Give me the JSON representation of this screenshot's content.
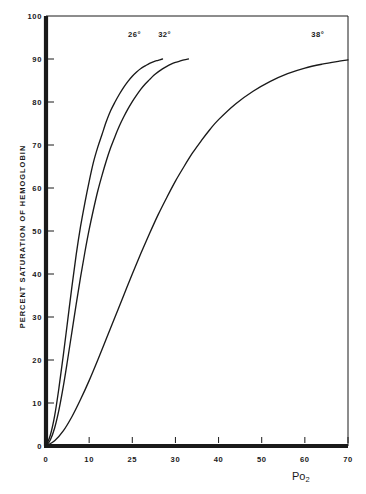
{
  "chart_data": {
    "type": "line",
    "title": "",
    "subtitle": "",
    "xlabel": "Po2",
    "xlabel_text": "Po",
    "xlabel_sub": "2",
    "ylabel": "PERCENT SATURATION OF HEMOGLOBIN",
    "xlim": [
      0,
      70
    ],
    "ylim": [
      0,
      100
    ],
    "xticks": [
      0,
      10,
      25,
      30,
      40,
      50,
      60,
      70
    ],
    "xtick_labels": [
      "0",
      "10",
      "25",
      "30",
      "40",
      "50",
      "60",
      "70"
    ],
    "yticks": [
      0,
      10,
      20,
      30,
      40,
      50,
      60,
      70,
      80,
      90,
      100
    ],
    "ytick_labels": [
      "0",
      "10",
      "20",
      "30",
      "40",
      "50",
      "60",
      "70",
      "80",
      "90",
      "100"
    ],
    "grid": false,
    "legend_position": "inline-annotations",
    "line_color": "#1a1a1a",
    "frame_color": "#1a1a1a",
    "background": "#ffffff",
    "series": [
      {
        "name": "26°",
        "label": "26°",
        "label_x": 20.5,
        "label_y": 95.5,
        "x": [
          0,
          1,
          2,
          3,
          4,
          5,
          6,
          7,
          8,
          9,
          10,
          11,
          12,
          13,
          14,
          15,
          16,
          17,
          18,
          19,
          20,
          21,
          22,
          23,
          24,
          25,
          26,
          27
        ],
        "values": [
          0,
          2.5,
          7,
          13.5,
          21,
          29,
          37,
          44.5,
          51,
          56.5,
          61.5,
          66,
          69.5,
          72.5,
          75.5,
          78,
          80,
          81.8,
          83.4,
          84.8,
          86,
          87,
          87.8,
          88.4,
          89,
          89.4,
          89.7,
          90
        ]
      },
      {
        "name": "32°",
        "label": "32°",
        "label_x": 27.5,
        "label_y": 95.5,
        "x": [
          0,
          1,
          2,
          3,
          4,
          5,
          6,
          7,
          8,
          9,
          10,
          11,
          12,
          13,
          14,
          15,
          16,
          17,
          18,
          19,
          20,
          21,
          22,
          23,
          24,
          25,
          26,
          27,
          28,
          29,
          30,
          31,
          32,
          33
        ],
        "values": [
          0,
          1.4,
          4.2,
          8.4,
          13.8,
          20,
          26.5,
          33,
          39.2,
          45,
          50.3,
          55,
          59.3,
          63,
          66.4,
          69.4,
          72,
          74.4,
          76.5,
          78.4,
          80.1,
          81.6,
          83,
          84.2,
          85.2,
          86.2,
          87,
          87.7,
          88.3,
          88.8,
          89.2,
          89.5,
          89.8,
          90
        ]
      },
      {
        "name": "38°",
        "label": "38°",
        "label_x": 63,
        "label_y": 95.5,
        "x": [
          0,
          2,
          4,
          6,
          8,
          10,
          12,
          14,
          16,
          18,
          20,
          22,
          24,
          26,
          28,
          30,
          32,
          34,
          36,
          38,
          40,
          44,
          48,
          52,
          56,
          60,
          64,
          68,
          70
        ],
        "values": [
          0,
          1.2,
          3.5,
          6.8,
          10.8,
          15.2,
          20,
          25,
          30,
          35,
          40,
          44.8,
          49.4,
          53.8,
          57.8,
          61.6,
          65,
          68.2,
          71,
          73.6,
          75.9,
          79.6,
          82.5,
          84.8,
          86.6,
          87.9,
          88.8,
          89.5,
          89.8
        ]
      }
    ]
  },
  "figure": {
    "plot_left_px": 46,
    "plot_right_px": 348,
    "plot_top_px": 16,
    "plot_bottom_px": 446
  }
}
